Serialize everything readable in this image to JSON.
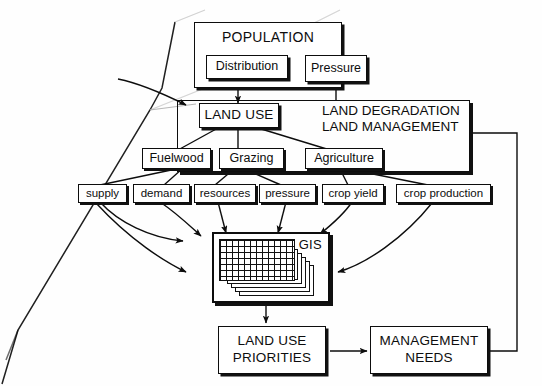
{
  "diagram": {
    "colors": {
      "ink": "#0d0d0d",
      "paper": "#ffffff",
      "shadow": "#111111"
    },
    "outer_frame": {
      "label_line1": "LAND DEGRADATION",
      "label_line2": "LAND MANAGEMENT",
      "label": "LAND DEGRADATION\nLAND MANAGEMENT"
    },
    "nodes": {
      "population": "POPULATION",
      "distribution": "Distribution",
      "pressure": "Pressure",
      "land_use": "LAND USE",
      "fuelwood": "Fuelwood",
      "grazing": "Grazing",
      "agriculture": "Agriculture",
      "supply": "supply",
      "demand": "demand",
      "resources": "resources",
      "pressure_small": "pressure",
      "crop_yield": "crop yield",
      "crop_production": "crop production",
      "gis": "GIS",
      "land_use_priorities_line1": "LAND USE",
      "land_use_priorities_line2": "PRIORITIES",
      "management_needs_line1": "MANAGEMENT",
      "management_needs_line2": "NEEDS"
    },
    "gis_stack": {
      "sheet_count": 6,
      "grid_cells": 14
    },
    "edges": [
      {
        "from": "distribution",
        "to": "pressure",
        "style": "straight"
      },
      {
        "from": "population",
        "to": "land_use",
        "style": "straight-arrow-down"
      },
      {
        "from": "pressure",
        "to": "outer_frame",
        "style": "straight-down"
      },
      {
        "from": "external-left",
        "to": "land_use",
        "style": "curved-arrow"
      },
      {
        "from": "land_use",
        "to": "fuelwood",
        "style": "straight"
      },
      {
        "from": "land_use",
        "to": "grazing",
        "style": "straight"
      },
      {
        "from": "land_use",
        "to": "agriculture",
        "style": "straight"
      },
      {
        "from": "fuelwood",
        "to": "supply",
        "style": "straight"
      },
      {
        "from": "fuelwood",
        "to": "demand",
        "style": "straight"
      },
      {
        "from": "grazing",
        "to": "resources",
        "style": "straight"
      },
      {
        "from": "grazing",
        "to": "pressure_small",
        "style": "straight"
      },
      {
        "from": "agriculture",
        "to": "crop_yield",
        "style": "straight"
      },
      {
        "from": "agriculture",
        "to": "crop_production",
        "style": "straight"
      },
      {
        "from": "supply",
        "to": "gis",
        "style": "curved-arrow"
      },
      {
        "from": "demand",
        "to": "gis",
        "style": "curved-arrow"
      },
      {
        "from": "resources",
        "to": "gis",
        "style": "curved-arrow"
      },
      {
        "from": "pressure_small",
        "to": "gis",
        "style": "curved-arrow"
      },
      {
        "from": "crop_yield",
        "to": "gis",
        "style": "curved-arrow"
      },
      {
        "from": "crop_production",
        "to": "gis",
        "style": "curved-arrow"
      },
      {
        "from": "gis",
        "to": "land_use_priorities",
        "style": "straight-arrow-down"
      },
      {
        "from": "land_use_priorities",
        "to": "management_needs",
        "style": "straight-arrow-right"
      },
      {
        "from": "management_needs",
        "to": "outer_frame",
        "style": "feedback-loop-right"
      }
    ]
  }
}
